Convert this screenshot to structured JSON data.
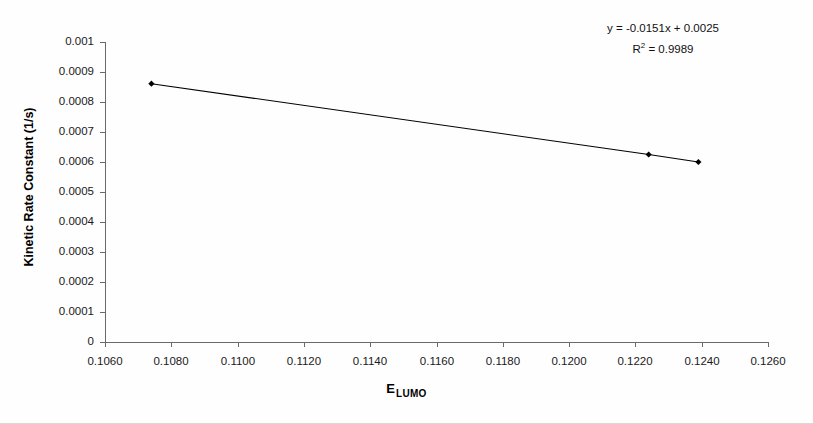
{
  "chart_data": {
    "type": "scatter",
    "title": "",
    "xlabel": "E",
    "xlabel_subscript": "LUMO",
    "ylabel": "Kinetic Rate Constant (1/s)",
    "xlim": [
      0.106,
      0.126
    ],
    "ylim": [
      0,
      0.001
    ],
    "grid": false,
    "legend": "none",
    "x_ticks": [
      "0.1060",
      "0.1080",
      "0.1100",
      "0.1120",
      "0.1140",
      "0.1160",
      "0.1180",
      "0.1200",
      "0.1220",
      "0.1240",
      "0.1260"
    ],
    "x_tick_values": [
      0.106,
      0.108,
      0.11,
      0.112,
      0.114,
      0.116,
      0.118,
      0.12,
      0.122,
      0.124,
      0.126
    ],
    "y_ticks": [
      "0.001",
      "0.0009",
      "0.0008",
      "0.0007",
      "0.0006",
      "0.0005",
      "0.0004",
      "0.0003",
      "0.0002",
      "0.0001",
      "0"
    ],
    "y_tick_values": [
      0.001,
      0.0009,
      0.0008,
      0.0007,
      0.0006,
      0.0005,
      0.0004,
      0.0003,
      0.0002,
      0.0001,
      0
    ],
    "series": [
      {
        "name": "kinetic rate constant vs E LUMO",
        "marker": "diamond",
        "marker_color": "#000000",
        "line_color": "#000000",
        "trendline": true,
        "x": [
          0.1074,
          0.1224,
          0.1239
        ],
        "y": [
          0.000861,
          0.000625,
          0.0006
        ]
      }
    ],
    "annotations": [
      {
        "name": "trendline-equation",
        "text": "y = -0.0151x + 0.0025"
      },
      {
        "name": "r-squared",
        "text_prefix": "R",
        "text_superscript": "2",
        "text_suffix": " = 0.9989",
        "value": 0.9989
      }
    ],
    "fit": {
      "slope": -0.0151,
      "intercept": 0.0025,
      "r_squared": 0.9989
    }
  }
}
